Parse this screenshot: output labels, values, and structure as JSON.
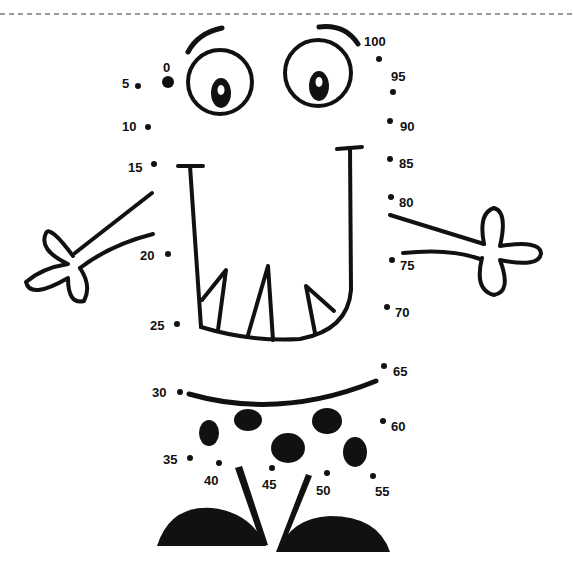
{
  "worksheet": {
    "type": "dot-to-dot",
    "separator": "dashed-line",
    "colors": {
      "ink": "#111111",
      "separator": "#999999",
      "background": "#ffffff"
    },
    "dots": [
      {
        "label": "0",
        "x": 168,
        "y": 82,
        "lx": 163,
        "ly": 61,
        "start": true
      },
      {
        "label": "5",
        "x": 138,
        "y": 86,
        "lx": 122,
        "ly": 77
      },
      {
        "label": "10",
        "x": 148,
        "y": 127,
        "lx": 122,
        "ly": 120
      },
      {
        "label": "15",
        "x": 154,
        "y": 164,
        "lx": 128,
        "ly": 161
      },
      {
        "label": "20",
        "x": 168,
        "y": 254,
        "lx": 140,
        "ly": 249
      },
      {
        "label": "25",
        "x": 177,
        "y": 324,
        "lx": 150,
        "ly": 319
      },
      {
        "label": "30",
        "x": 180,
        "y": 392,
        "lx": 152,
        "ly": 386
      },
      {
        "label": "35",
        "x": 190,
        "y": 458,
        "lx": 163,
        "ly": 453
      },
      {
        "label": "40",
        "x": 219,
        "y": 463,
        "lx": 204,
        "ly": 474
      },
      {
        "label": "45",
        "x": 272,
        "y": 468,
        "lx": 262,
        "ly": 478
      },
      {
        "label": "50",
        "x": 327,
        "y": 473,
        "lx": 316,
        "ly": 484
      },
      {
        "label": "55",
        "x": 373,
        "y": 476,
        "lx": 375,
        "ly": 485
      },
      {
        "label": "60",
        "x": 383,
        "y": 421,
        "lx": 391,
        "ly": 420
      },
      {
        "label": "65",
        "x": 384,
        "y": 366,
        "lx": 393,
        "ly": 365
      },
      {
        "label": "70",
        "x": 387,
        "y": 307,
        "lx": 395,
        "ly": 306
      },
      {
        "label": "75",
        "x": 392,
        "y": 260,
        "lx": 400,
        "ly": 259
      },
      {
        "label": "80",
        "x": 391,
        "y": 197,
        "lx": 399,
        "ly": 196
      },
      {
        "label": "85",
        "x": 390,
        "y": 159,
        "lx": 399,
        "ly": 157
      },
      {
        "label": "90",
        "x": 390,
        "y": 121,
        "lx": 400,
        "ly": 120
      },
      {
        "label": "95",
        "x": 393,
        "y": 92,
        "lx": 391,
        "ly": 70
      },
      {
        "label": "100",
        "x": 379,
        "y": 59,
        "lx": 364,
        "ly": 35
      }
    ],
    "figure_parts": [
      "left-eyebrow",
      "left-eye",
      "right-eyebrow",
      "right-eye",
      "mouth-with-teeth",
      "left-arm-hand",
      "right-arm-hand",
      "belly-line",
      "spots",
      "left-leg",
      "right-leg",
      "left-foot",
      "right-foot"
    ]
  }
}
